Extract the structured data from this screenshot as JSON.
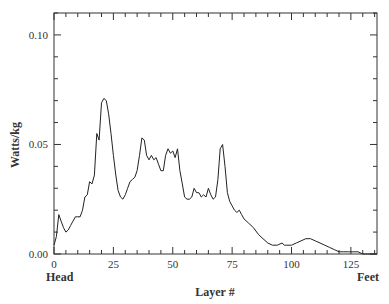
{
  "chart_data": {
    "type": "line",
    "title": "",
    "xlabel": "Layer #",
    "ylabel": "Watts/kg",
    "x_end_labels": {
      "left": "Head",
      "right": "Feet"
    },
    "xlim": [
      0,
      136
    ],
    "ylim": [
      0.0,
      0.11
    ],
    "xticks": [
      0,
      25,
      50,
      75,
      100,
      125
    ],
    "xtick_labels": [
      "0",
      "25",
      "50",
      "75",
      "100",
      "125"
    ],
    "yticks": [
      0.0,
      0.05,
      0.1
    ],
    "ytick_labels": [
      "0.00",
      "0.05",
      "0.10"
    ],
    "grid": false,
    "legend": null,
    "series": [
      {
        "name": "SAR",
        "x": [
          0,
          1,
          2,
          3,
          4,
          5,
          6,
          7,
          8,
          9,
          10,
          11,
          12,
          13,
          14,
          15,
          16,
          17,
          18,
          19,
          20,
          21,
          22,
          23,
          24,
          25,
          26,
          27,
          28,
          29,
          30,
          31,
          32,
          33,
          34,
          35,
          36,
          37,
          38,
          39,
          40,
          41,
          42,
          43,
          44,
          45,
          46,
          47,
          48,
          49,
          50,
          51,
          52,
          53,
          54,
          55,
          56,
          57,
          58,
          59,
          60,
          61,
          62,
          63,
          64,
          65,
          66,
          67,
          68,
          69,
          70,
          71,
          72,
          73,
          74,
          75,
          76,
          77,
          78,
          79,
          80,
          82,
          84,
          86,
          88,
          90,
          92,
          94,
          96,
          97,
          98,
          100,
          102,
          104,
          106,
          108,
          110,
          112,
          114,
          116,
          118,
          120,
          122,
          124,
          126,
          128,
          130,
          132,
          134,
          136
        ],
        "y": [
          0.004,
          0.008,
          0.018,
          0.015,
          0.012,
          0.01,
          0.011,
          0.013,
          0.015,
          0.017,
          0.017,
          0.017,
          0.02,
          0.026,
          0.027,
          0.033,
          0.032,
          0.036,
          0.055,
          0.052,
          0.069,
          0.071,
          0.07,
          0.064,
          0.055,
          0.045,
          0.036,
          0.029,
          0.026,
          0.025,
          0.027,
          0.03,
          0.033,
          0.034,
          0.035,
          0.038,
          0.045,
          0.053,
          0.052,
          0.045,
          0.043,
          0.045,
          0.043,
          0.044,
          0.041,
          0.038,
          0.038,
          0.045,
          0.048,
          0.046,
          0.047,
          0.044,
          0.048,
          0.038,
          0.032,
          0.026,
          0.025,
          0.025,
          0.026,
          0.03,
          0.028,
          0.028,
          0.026,
          0.027,
          0.026,
          0.03,
          0.027,
          0.025,
          0.026,
          0.034,
          0.048,
          0.05,
          0.04,
          0.028,
          0.024,
          0.022,
          0.02,
          0.019,
          0.02,
          0.018,
          0.016,
          0.014,
          0.012,
          0.009,
          0.007,
          0.005,
          0.004,
          0.004,
          0.005,
          0.004,
          0.004,
          0.004,
          0.005,
          0.006,
          0.007,
          0.007,
          0.006,
          0.005,
          0.004,
          0.003,
          0.002,
          0.001,
          0.001,
          0.001,
          0.001,
          0.001,
          0.0,
          0.0,
          0.0,
          0.0
        ]
      }
    ]
  }
}
